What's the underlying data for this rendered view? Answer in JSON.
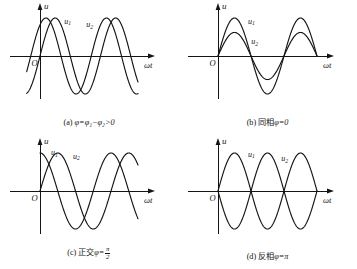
{
  "figure": {
    "background": "#ffffff",
    "stroke_color": "#141414",
    "axis_label_u": "u",
    "axis_label_wt": "ωt",
    "origin_label": "O",
    "curve_label_1": "u",
    "curve_label_1_sub": "1",
    "curve_label_2": "u",
    "curve_label_2_sub": "2"
  },
  "chart_data": {
    "type": "line",
    "xlabel": "ωt",
    "ylabel": "u",
    "grid": false,
    "legend": "inline-curve-labels",
    "panels": [
      {
        "id": "a",
        "tag": "(a)",
        "caption_cn": "",
        "caption_math": "φ=φ₁−φ₂>0",
        "phase_difference_deg": 55,
        "description": "u1 leads u2 by a positive phase angle",
        "series": [
          {
            "name": "u1",
            "amplitude": 1.0,
            "phase_deg": 55,
            "periods": 1.62,
            "label_x_frac": 0.22,
            "label_y_frac": 0.2
          },
          {
            "name": "u2",
            "amplitude": 1.0,
            "phase_deg": 0,
            "periods": 1.62,
            "label_x_frac": 0.42,
            "label_y_frac": 0.28
          }
        ],
        "x_start": -0.22,
        "ylim": [
          -1.18,
          1.18
        ]
      },
      {
        "id": "b",
        "tag": "(b)",
        "caption_cn": "同相",
        "caption_math": "φ=0",
        "phase_difference_deg": 0,
        "description": "u1 and u2 in phase, different amplitudes",
        "series": [
          {
            "name": "u1",
            "amplitude": 1.0,
            "phase_deg": 0,
            "periods": 1.5,
            "label_x_frac": 0.27,
            "label_y_frac": 0.2
          },
          {
            "name": "u2",
            "amplitude": 0.62,
            "phase_deg": 0,
            "periods": 1.5,
            "label_x_frac": 0.3,
            "label_y_frac": 0.62
          }
        ],
        "x_start": 0.0,
        "ylim": [
          -1.18,
          1.18
        ]
      },
      {
        "id": "c",
        "tag": "(c)",
        "caption_cn": "正交",
        "caption_math": "φ=",
        "caption_frac_num": "π",
        "caption_frac_den": "2",
        "phase_difference_deg": 90,
        "description": "u1 is a cosine (quarter-period lead), u2 is a sine; quadrature",
        "series": [
          {
            "name": "u1",
            "amplitude": 1.0,
            "phase_deg": 90,
            "periods": 1.38,
            "label_x_frac": 0.1,
            "label_y_frac": 0.12
          },
          {
            "name": "u2",
            "amplitude": 1.0,
            "phase_deg": 0,
            "periods": 1.38,
            "label_x_frac": 0.3,
            "label_y_frac": 0.2
          }
        ],
        "x_start": 0.0,
        "ylim": [
          -1.18,
          1.18
        ]
      },
      {
        "id": "d",
        "tag": "(d)",
        "caption_cn": "反相",
        "caption_math": "φ=π",
        "phase_difference_deg": 180,
        "description": "u1 and u2 exactly opposite in phase, mirror images",
        "series": [
          {
            "name": "u1",
            "amplitude": 1.0,
            "phase_deg": 0,
            "periods": 1.5,
            "label_x_frac": 0.27,
            "label_y_frac": 0.16
          },
          {
            "name": "u2",
            "amplitude": 1.0,
            "phase_deg": 180,
            "periods": 1.5,
            "label_x_frac": 0.57,
            "label_y_frac": 0.26
          }
        ],
        "x_start": 0.0,
        "ylim": [
          -1.18,
          1.18
        ]
      }
    ]
  }
}
